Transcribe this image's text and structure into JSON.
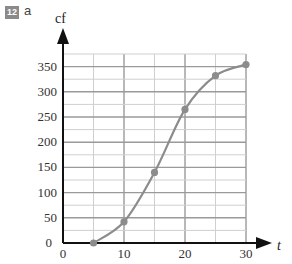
{
  "question": {
    "number": "12",
    "part": "a"
  },
  "chart_data": {
    "type": "line",
    "title": "",
    "xlabel": "t",
    "ylabel": "cf",
    "x": [
      5,
      10,
      15,
      20,
      25,
      30
    ],
    "series": [
      {
        "name": "cumulative frequency",
        "values": [
          0,
          42,
          140,
          265,
          332,
          354
        ]
      }
    ],
    "xticks": [
      "0",
      "10",
      "20",
      "30"
    ],
    "yticks": [
      "0",
      "50",
      "100",
      "150",
      "200",
      "250",
      "300",
      "350"
    ],
    "xlim": [
      0,
      30
    ],
    "ylim": [
      0,
      375
    ],
    "grid": true,
    "minor_grid_x_step": 5,
    "minor_grid_y_step": 25,
    "colors": {
      "curve": "#8c8c8c",
      "grid_major": "#9a9a9a",
      "grid_minor": "#cfcfcf",
      "axis": "#111111"
    }
  }
}
